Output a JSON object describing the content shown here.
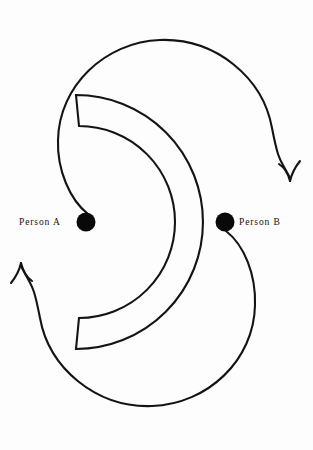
{
  "figure": {
    "background_color": "#fdfdfd",
    "ink_color": "#141414",
    "dot_color": "#090909"
  },
  "labels": {
    "person_a": "Person A",
    "person_b": "Person B"
  },
  "nodes": [
    {
      "name": "person-a-dot",
      "label": "Person A",
      "cx": 86,
      "cy": 222,
      "r": 9.5
    },
    {
      "name": "person-b-dot",
      "label": "Person B",
      "cx": 225,
      "cy": 222,
      "r": 9.5
    }
  ],
  "arrows": [
    {
      "name": "upper-arc-arrowhead",
      "x": 291,
      "y": 182,
      "direction": "down"
    },
    {
      "name": "lower-arc-arrowhead",
      "x": 20,
      "y": 262,
      "direction": "up"
    }
  ],
  "shapes": {
    "upper_circle": {
      "cx": 165,
      "cy": 125,
      "r": 107
    },
    "lower_circle": {
      "cx": 147,
      "cy": 318,
      "r": 106
    },
    "crescent_band": {
      "cx": 156,
      "cy": 222,
      "outer_r": 82,
      "inner_r": 52
    }
  }
}
